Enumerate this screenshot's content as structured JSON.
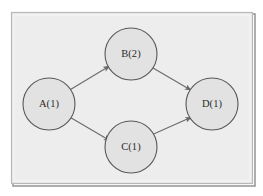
{
  "figure": {
    "kind": "directed-graph-diagram",
    "canvas": {
      "width": 263,
      "height": 196,
      "background_color": "#ffffff"
    },
    "frame": {
      "x": 11,
      "y": 12,
      "width": 242,
      "height": 172,
      "fill_color": "#eeeeee",
      "border_color": "#b4b4b4",
      "shadow_color": "#8d8d8d"
    },
    "style": {
      "node_fill_color": "#e2e2e2",
      "node_stroke_color": "#585858",
      "node_stroke_width": 1.1,
      "node_radius": 26,
      "edge_color": "#6b6b6b",
      "edge_width": 1.1,
      "label_color": "#2b2b2b",
      "label_font_size": 10.5
    }
  },
  "graph": {
    "nodes": [
      {
        "id": "A",
        "label": "A(1)",
        "name": "A",
        "weight": 1,
        "cx": 49,
        "cy": 104
      },
      {
        "id": "B",
        "label": "B(2)",
        "name": "B",
        "weight": 2,
        "cx": 131,
        "cy": 54
      },
      {
        "id": "C",
        "label": "C(1)",
        "name": "C",
        "weight": 1,
        "cx": 131,
        "cy": 147
      },
      {
        "id": "D",
        "label": "D(1)",
        "name": "D",
        "weight": 1,
        "cx": 212,
        "cy": 104
      }
    ],
    "edges": [
      {
        "id": "A-B",
        "from": "A",
        "to": "B",
        "directed": true,
        "arrowhead": "filled-triangle"
      },
      {
        "id": "A-C",
        "from": "A",
        "to": "C",
        "directed": true,
        "arrowhead": "filled-triangle"
      },
      {
        "id": "B-D",
        "from": "B",
        "to": "D",
        "directed": true,
        "arrowhead": "filled-triangle"
      },
      {
        "id": "C-D",
        "from": "C",
        "to": "D",
        "directed": true,
        "arrowhead": "filled-triangle"
      }
    ]
  }
}
